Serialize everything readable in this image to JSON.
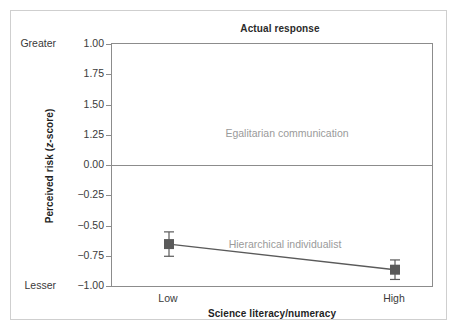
{
  "chart_data": {
    "type": "line",
    "title": "Actual response",
    "xlabel": "Science literacy/numeracy",
    "ylabel": "Perceived risk (z-score)",
    "ylabel_plain": "Perceived risk (",
    "ylabel_italic": "z",
    "ylabel_tail": "-score)",
    "categories": [
      "Low",
      "High"
    ],
    "x": [
      0,
      1
    ],
    "ylim": [
      -1.0,
      1.0
    ],
    "yticks": [
      1.0,
      1.75,
      1.5,
      1.25,
      0.0,
      -0.25,
      -0.5,
      -0.75,
      -1.0
    ],
    "ytick_labels": [
      "1.00",
      "1.75",
      "1.50",
      "1.25",
      "0.00",
      "−0.25",
      "−0.50",
      "−0.75",
      "−1.00"
    ],
    "y_extreme_labels": {
      "top": "Greater",
      "bottom": "Lesser"
    },
    "grid": false,
    "legend_position": "inline-annotation",
    "zero_reference_line": 0.0,
    "series": [
      {
        "name": "Egalitarian communication",
        "marker": "diamond",
        "color": "#6b6b6b",
        "values": [
          1.7,
          1.81
        ],
        "errors": [
          0.11,
          0.08
        ],
        "error_low": [
          1.59,
          1.73
        ],
        "error_high": [
          1.81,
          1.89
        ]
      },
      {
        "name": "Hierarchical individualist",
        "marker": "square",
        "color": "#5a5a5a",
        "values": [
          -0.64,
          -0.85
        ],
        "errors": [
          0.1,
          0.08
        ],
        "error_low": [
          -0.74,
          -0.93
        ],
        "error_high": [
          -0.54,
          -0.77
        ]
      }
    ],
    "annotations": [
      {
        "text": "Egalitarian communication",
        "color": "#9a9a9a"
      },
      {
        "text": "Hierarchical individualist",
        "color": "#9a9a9a"
      }
    ],
    "colors": {
      "axis": "#8c8c8c",
      "outer_frame": "#cfcfcf",
      "text": "#3a3a3a",
      "title": "#2b2b2b",
      "annotation": "#9a9a9a",
      "series_1": "#6b6b6b",
      "series_2": "#5a5a5a",
      "background": "#ffffff"
    }
  }
}
